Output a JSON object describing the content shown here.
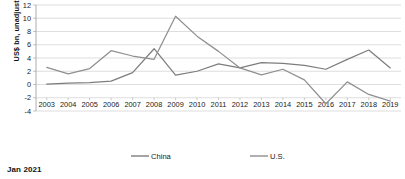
{
  "caption": "Jan 2021",
  "chart_data": {
    "type": "line",
    "title": "",
    "xlabel": "",
    "ylabel": "US$ bn, unadjusted",
    "ylim": [
      -4,
      12
    ],
    "ytick_step": 2,
    "yticks": [
      12,
      10,
      8,
      6,
      4,
      2,
      0,
      -2,
      -4
    ],
    "ytick_labels": [
      "12",
      "10",
      "8",
      "6",
      "4",
      "2",
      "0",
      "-2",
      "-4"
    ],
    "grid": true,
    "legend_position": "bottom",
    "categories": [
      "2003",
      "2004",
      "2005",
      "2006",
      "2007",
      "2008",
      "2009",
      "2010",
      "2011",
      "2012",
      "2013",
      "2014",
      "2015",
      "2016",
      "2017",
      "2018",
      "2019"
    ],
    "series": [
      {
        "name": "China",
        "color": "#7d7d7d",
        "values": [
          0.05,
          0.2,
          0.3,
          0.5,
          1.8,
          5.4,
          1.4,
          2.0,
          3.1,
          2.5,
          3.3,
          3.2,
          2.9,
          2.3,
          3.8,
          5.2,
          2.5
        ]
      },
      {
        "name": "U.S.",
        "color": "#8f8f8f",
        "values": [
          2.6,
          1.6,
          2.4,
          5.1,
          4.3,
          3.8,
          10.3,
          7.3,
          5.0,
          2.5,
          1.45,
          2.3,
          0.7,
          -2.9,
          0.4,
          -1.5,
          -2.5
        ]
      }
    ],
    "axis_color": "#9a9a9a",
    "grid_color": "#c8c8c8"
  }
}
